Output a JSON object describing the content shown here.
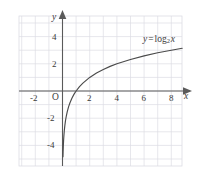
{
  "figure": {
    "kind": "coordinate-plane-graph",
    "width": 199,
    "height": 176,
    "background": "#ffffff"
  },
  "chart_data": {
    "type": "line",
    "title": "",
    "subtitle": "",
    "xlabel": "x",
    "ylabel": "y",
    "xlim": [
      -3.2,
      8.8
    ],
    "ylim": [
      -5.5,
      5.5
    ],
    "grid": true,
    "grid_spacing": 1,
    "legend_position": "none",
    "annotations": [
      {
        "text": "y = log2 x",
        "x": 6.4,
        "y": 3.6
      }
    ],
    "xticks": [
      -2,
      0,
      2,
      4,
      6,
      8
    ],
    "xtick_labels": [
      "-2",
      "O",
      "2",
      "4",
      "6",
      "8"
    ],
    "yticks": [
      -4,
      -2,
      2,
      4
    ],
    "ytick_labels": [
      "-4",
      "-2",
      "2",
      "4"
    ],
    "series": [
      {
        "name": "y = log2 x",
        "expression": "y = log_2(x)",
        "base": 2,
        "color": "#4a4a4a",
        "asymptote_x": 0,
        "x": [
          0.035,
          0.045,
          0.06,
          0.08,
          0.1,
          0.13,
          0.17,
          0.22,
          0.28,
          0.35,
          0.45,
          0.55,
          0.7,
          0.85,
          1.0,
          1.25,
          1.5,
          2.0,
          2.5,
          3.0,
          3.5,
          4.0,
          5.0,
          6.0,
          7.0,
          8.0,
          8.8
        ],
        "y": [
          -4.84,
          -4.47,
          -4.06,
          -3.64,
          -3.32,
          -2.94,
          -2.56,
          -2.18,
          -1.84,
          -1.51,
          -1.15,
          -0.86,
          -0.51,
          -0.23,
          0.0,
          0.32,
          0.58,
          1.0,
          1.32,
          1.58,
          1.81,
          2.0,
          2.32,
          2.58,
          2.81,
          3.0,
          3.14
        ],
        "key_points": [
          {
            "x": 1,
            "y": 0
          },
          {
            "x": 2,
            "y": 1
          },
          {
            "x": 4,
            "y": 2
          },
          {
            "x": 8,
            "y": 3
          }
        ]
      }
    ]
  },
  "axes": {
    "x_axis_name": "x",
    "y_axis_name": "y",
    "origin_label": "O",
    "x_arrow": "right-arrow",
    "y_arrow": "up-arrow",
    "axis_color": "#5a5a5a",
    "grid_color": "#d9d9e2"
  },
  "labels": {
    "x_neg2": "-2",
    "x_2": "2",
    "x_4": "4",
    "x_6": "6",
    "x_8": "8",
    "y_4": "4",
    "y_2": "2",
    "y_neg2": "-2",
    "y_neg4": "-4"
  },
  "curve_label": {
    "y": "y",
    "equals": "=",
    "log": "log",
    "base": "2",
    "argument": "x"
  }
}
